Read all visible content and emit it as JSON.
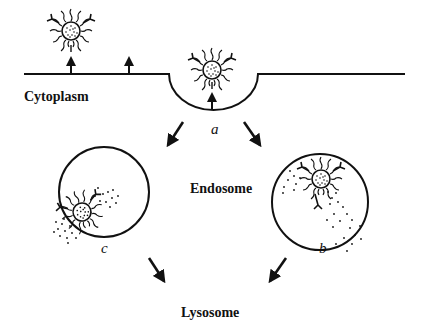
{
  "labels": {
    "cytoplasm": "Cytoplasm",
    "endosome": "Endosome",
    "lysosome": "Lysosome",
    "a": "a",
    "b": "b",
    "c": "c"
  },
  "colors": {
    "ink": "#111111",
    "background": "#ffffff"
  },
  "elements": {
    "membrane": "cell membrane with coated pit",
    "particles": [
      "receptor-bound particle (outside)",
      "particle in pit",
      "particle in endosome b",
      "particle in endosome c"
    ],
    "arrows": [
      "pit to endosome c",
      "pit to endosome b",
      "endosome c to lysosome",
      "endosome b to lysosome"
    ]
  }
}
